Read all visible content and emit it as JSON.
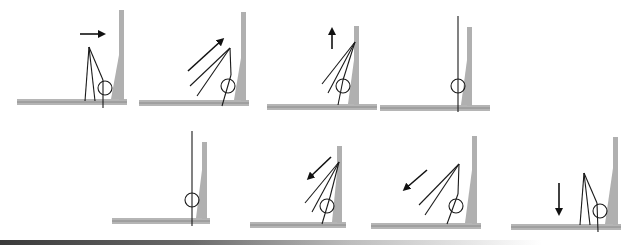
{
  "diagram": {
    "title": "",
    "colors": {
      "floor": "#b5b5b5",
      "wall": "#b0b0b0",
      "ink": "#1a1a1a"
    },
    "rows": [
      {
        "panels": [
          {
            "index": 1,
            "arrow": "right-arrow-icon",
            "arrow_direction": "right",
            "state": "lines converge to apex, circle at wall base"
          },
          {
            "index": 2,
            "arrow": "up-right-arrow-icon",
            "arrow_direction": "up-right",
            "state": "lines fan leftward, tilted"
          },
          {
            "index": 3,
            "arrow": "up-arrow-icon",
            "arrow_direction": "up",
            "state": "lines fan from wall top"
          },
          {
            "index": 4,
            "arrow": "none",
            "arrow_direction": "none",
            "state": "single vertical line through circle"
          }
        ]
      },
      {
        "panels": [
          {
            "index": 5,
            "arrow": "none",
            "arrow_direction": "none",
            "state": "single vertical line through circle"
          },
          {
            "index": 6,
            "arrow": "down-left-arrow-icon",
            "arrow_direction": "down-left",
            "state": "lines fan from wall top"
          },
          {
            "index": 7,
            "arrow": "down-left-arrow-icon",
            "arrow_direction": "down-left",
            "state": "lines fan leftward, tilted"
          },
          {
            "index": 8,
            "arrow": "down-arrow-icon",
            "arrow_direction": "down",
            "state": "lines converge to apex, circle at wall base"
          }
        ]
      }
    ]
  }
}
